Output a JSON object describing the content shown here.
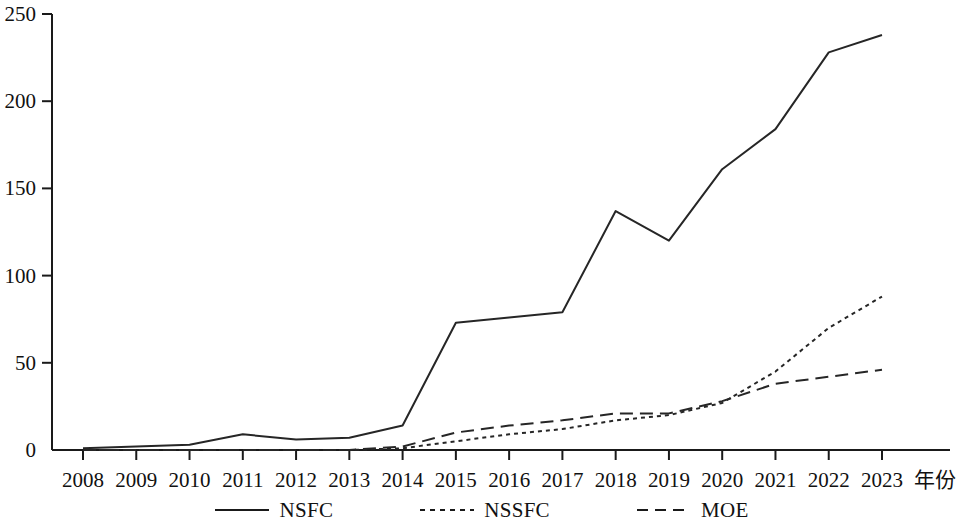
{
  "chart_data": {
    "type": "line",
    "title": "",
    "subtitle": "",
    "xlabel": "年份",
    "ylabel": "",
    "x": [
      2008,
      2009,
      2010,
      2011,
      2012,
      2013,
      2014,
      2015,
      2016,
      2017,
      2018,
      2019,
      2020,
      2021,
      2022,
      2023
    ],
    "categories": [
      "2008",
      "2009",
      "2010",
      "2011",
      "2012",
      "2013",
      "2014",
      "2015",
      "2016",
      "2017",
      "2018",
      "2019",
      "2020",
      "2021",
      "2022",
      "2023"
    ],
    "xlim": [
      2008,
      2023
    ],
    "ylim": [
      0,
      250
    ],
    "yticks": [
      0,
      50,
      100,
      150,
      200,
      250
    ],
    "ytick_labels": [
      "0",
      "50",
      "100",
      "150",
      "200",
      "250"
    ],
    "grid": false,
    "legend_position": "bottom",
    "series": [
      {
        "name": "NSFC",
        "linestyle": "solid",
        "color": "#262626",
        "values": [
          1,
          2,
          3,
          9,
          6,
          7,
          14,
          73,
          76,
          79,
          137,
          120,
          161,
          184,
          228,
          238
        ]
      },
      {
        "name": "NSSFC",
        "linestyle": "dotted",
        "color": "#262626",
        "values": [
          0,
          0,
          0,
          0,
          0,
          0,
          1,
          5,
          9,
          12,
          17,
          20,
          27,
          45,
          70,
          88
        ]
      },
      {
        "name": "MOE",
        "linestyle": "dashed",
        "color": "#262626",
        "values": [
          0,
          0,
          0,
          0,
          0,
          0,
          2,
          10,
          14,
          17,
          21,
          21,
          28,
          38,
          42,
          46
        ]
      }
    ]
  },
  "axes": {
    "x_axis_title": "年份",
    "y_tick_labels": [
      "0",
      "50",
      "100",
      "150",
      "200",
      "250"
    ],
    "x_tick_labels": [
      "2008",
      "2009",
      "2010",
      "2011",
      "2012",
      "2013",
      "2014",
      "2015",
      "2016",
      "2017",
      "2018",
      "2019",
      "2020",
      "2021",
      "2022",
      "2023"
    ]
  },
  "legend": {
    "items": [
      {
        "label": "NSFC",
        "style": "solid"
      },
      {
        "label": "NSSFC",
        "style": "dotted"
      },
      {
        "label": "MOE",
        "style": "dashed"
      }
    ]
  }
}
